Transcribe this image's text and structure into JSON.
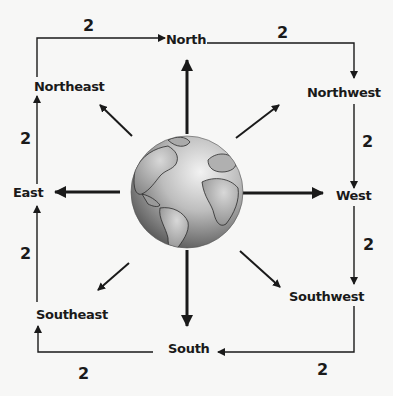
{
  "diagram": {
    "center": {
      "icon": "globe-icon"
    },
    "directions": [
      {
        "id": "north",
        "label": "North"
      },
      {
        "id": "northwest",
        "label": "Northwest"
      },
      {
        "id": "west",
        "label": "West"
      },
      {
        "id": "southwest",
        "label": "Southwest"
      },
      {
        "id": "south",
        "label": "South"
      },
      {
        "id": "southeast",
        "label": "Southeast"
      },
      {
        "id": "east",
        "label": "East"
      },
      {
        "id": "northeast",
        "label": "Northeast"
      }
    ],
    "edge_weights": {
      "northeast_to_north": "2",
      "north_to_northwest": "2",
      "northwest_to_west": "2",
      "west_to_southwest": "2",
      "southwest_to_south": "2",
      "south_to_southeast": "2",
      "southeast_to_east": "2",
      "east_to_northeast": "2"
    },
    "colors": {
      "line": "#1a1a1a",
      "background": "#f7f7f6"
    }
  }
}
